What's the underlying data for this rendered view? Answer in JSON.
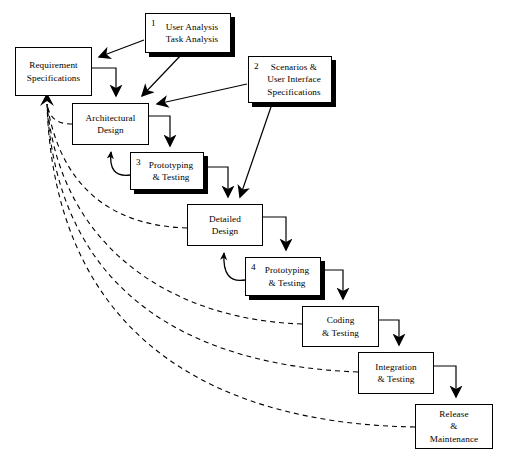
{
  "diagram": {
    "type": "flowchart",
    "canvas": {
      "width": 505,
      "height": 462
    },
    "colors": {
      "stroke": "#000000",
      "fill": "#ffffff",
      "shadow": "#000000"
    }
  },
  "nodes": [
    {
      "id": "user-analysis",
      "number": "1",
      "label": "User Analysis\nTask Analysis",
      "x": 145,
      "y": 13,
      "w": 86,
      "h": 40,
      "shadow": true,
      "numbered": true
    },
    {
      "id": "requirement-specifications",
      "number": "",
      "label": "Requirement\nSpecifications",
      "x": 15,
      "y": 47,
      "w": 77,
      "h": 49,
      "shadow": false,
      "numbered": false
    },
    {
      "id": "scenarios-ui-specifications",
      "number": "2",
      "label": "Scenarios &\nUser Interface\nSpecifications",
      "x": 248,
      "y": 56,
      "w": 84,
      "h": 47,
      "shadow": true,
      "numbered": true
    },
    {
      "id": "architectural-design",
      "number": "",
      "label": "Architectural\nDesign",
      "x": 72,
      "y": 103,
      "w": 77,
      "h": 42,
      "shadow": false,
      "numbered": false
    },
    {
      "id": "prototyping-testing-3",
      "number": "3",
      "label": "Prototyping\n& Testing",
      "x": 130,
      "y": 152,
      "w": 74,
      "h": 38,
      "shadow": true,
      "numbered": true
    },
    {
      "id": "detailed-design",
      "number": "",
      "label": "Detailed\nDesign",
      "x": 187,
      "y": 204,
      "w": 76,
      "h": 42,
      "shadow": false,
      "numbered": false
    },
    {
      "id": "prototyping-testing-4",
      "number": "4",
      "label": "Prototyping\n& Testing",
      "x": 245,
      "y": 257,
      "w": 76,
      "h": 39,
      "shadow": true,
      "numbered": true
    },
    {
      "id": "coding-testing",
      "number": "",
      "label": "Coding\n& Testing",
      "x": 302,
      "y": 306,
      "w": 77,
      "h": 41,
      "shadow": false,
      "numbered": false
    },
    {
      "id": "integration-testing",
      "number": "",
      "label": "Integration\n& Testing",
      "x": 358,
      "y": 352,
      "w": 76,
      "h": 42,
      "shadow": false,
      "numbered": false
    },
    {
      "id": "release-maintenance",
      "number": "",
      "label": "Release\n&\nMaintenance",
      "x": 415,
      "y": 404,
      "w": 78,
      "h": 45,
      "shadow": false,
      "numbered": false
    }
  ],
  "edges": {
    "diagonal_inputs": [
      {
        "from": "user-analysis",
        "to": "requirement-specifications"
      },
      {
        "from": "user-analysis",
        "to": "architectural-design"
      },
      {
        "from": "scenarios-ui-specifications",
        "to": "architectural-design"
      },
      {
        "from": "scenarios-ui-specifications",
        "to": "detailed-design"
      }
    ],
    "step_flow": [
      {
        "from": "requirement-specifications",
        "to": "architectural-design"
      },
      {
        "from": "architectural-design",
        "to": "prototyping-testing-3"
      },
      {
        "from": "prototyping-testing-3",
        "to": "detailed-design"
      },
      {
        "from": "detailed-design",
        "to": "prototyping-testing-4"
      },
      {
        "from": "prototyping-testing-4",
        "to": "coding-testing"
      },
      {
        "from": "coding-testing",
        "to": "integration-testing"
      },
      {
        "from": "integration-testing",
        "to": "release-maintenance"
      }
    ],
    "prototype_feedback": [
      {
        "from": "prototyping-testing-3",
        "to": "architectural-design"
      },
      {
        "from": "prototyping-testing-4",
        "to": "detailed-design"
      }
    ],
    "dashed_feedback_to_requirements": [
      {
        "from": "architectural-design",
        "to": "requirement-specifications"
      },
      {
        "from": "detailed-design",
        "to": "requirement-specifications"
      },
      {
        "from": "coding-testing",
        "to": "requirement-specifications"
      },
      {
        "from": "integration-testing",
        "to": "requirement-specifications"
      },
      {
        "from": "release-maintenance",
        "to": "requirement-specifications"
      }
    ]
  }
}
